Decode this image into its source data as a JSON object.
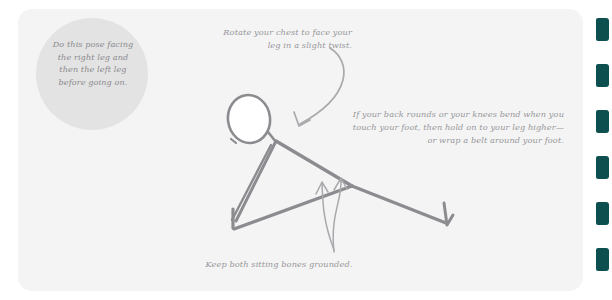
{
  "page": {
    "background_color": "#ffffff",
    "card_color": "#f4f4f4"
  },
  "note_circle": {
    "color": "#e3e3e3",
    "lines": [
      "Do this pose facing",
      "the right leg and",
      "then the left leg",
      "before going on."
    ],
    "text": "Do this pose facing the right leg and then the left leg before going on."
  },
  "captions": {
    "top": {
      "lines": [
        "Rotate your chest to face your",
        "leg in a slight twist."
      ],
      "text": "Rotate your chest to face your leg in a slight twist."
    },
    "right": {
      "lines": [
        "If your back rounds or your knees bend when you",
        "touch your foot, then hold on to your leg higher—",
        "or wrap a belt around your foot."
      ],
      "text": "If your back rounds or your knees bend when you touch your foot, then hold on to your leg higher— or wrap a belt around your foot."
    },
    "bottom": {
      "lines": [
        "Keep both sitting bones grounded."
      ],
      "text": "Keep both sitting bones grounded."
    }
  },
  "figure": {
    "name": "seated-forward-bend-stick-figure",
    "stroke_color": "#8c8c90",
    "head_fill": "#ffffff"
  },
  "arrows": {
    "chest_rotation": "curved-down-arrow",
    "sitting_bones": "double-up-arrow"
  },
  "tabs": {
    "color": "#0d4f4f",
    "count": 6,
    "items": [
      {
        "name": "index-tab-1",
        "top": 18
      },
      {
        "name": "index-tab-2",
        "top": 64
      },
      {
        "name": "index-tab-3",
        "top": 110
      },
      {
        "name": "index-tab-4",
        "top": 156
      },
      {
        "name": "index-tab-5",
        "top": 202
      },
      {
        "name": "index-tab-6",
        "top": 248
      }
    ]
  }
}
